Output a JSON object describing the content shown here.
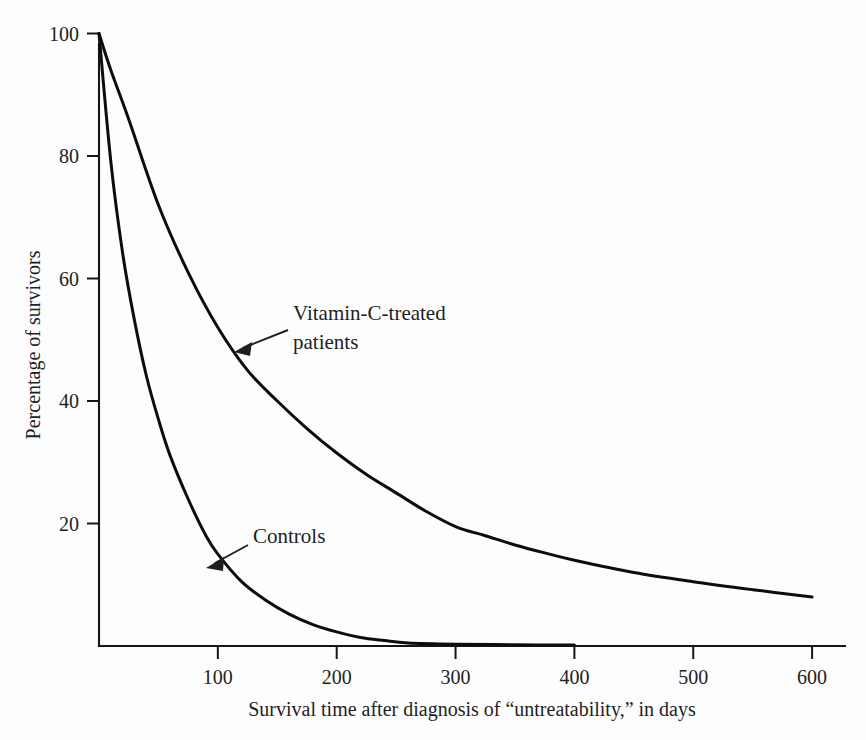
{
  "figure": {
    "background_color": "#fdfdfd",
    "ink_color": "#0d0d0d"
  },
  "chart_data": {
    "type": "line",
    "title": "",
    "xlabel": "Survival time after diagnosis of “untreatability,” in days",
    "ylabel": "Percentage of survivors",
    "xlim": [
      0,
      620
    ],
    "ylim": [
      0,
      104
    ],
    "grid": false,
    "legend": "none",
    "xticks": [
      100,
      200,
      300,
      400,
      500,
      600
    ],
    "xtick_labels": [
      "100",
      "200",
      "300",
      "400",
      "500",
      "600"
    ],
    "yticks": [
      20,
      40,
      60,
      80,
      100
    ],
    "ytick_labels": [
      "20",
      "40",
      "60",
      "80",
      "100"
    ],
    "series": [
      {
        "name": "Vitamin-C-treated patients",
        "x": [
          0,
          10,
          25,
          50,
          75,
          100,
          125,
          150,
          175,
          200,
          225,
          250,
          275,
          300,
          325,
          350,
          375,
          400,
          450,
          500,
          550,
          600
        ],
        "values": [
          100,
          94,
          86,
          72,
          61,
          52,
          45,
          40,
          35.5,
          31.5,
          28,
          25,
          22,
          19.5,
          18,
          16.5,
          15.2,
          14,
          12,
          10.5,
          9.2,
          8
        ]
      },
      {
        "name": "Controls",
        "x": [
          0,
          10,
          20,
          30,
          40,
          50,
          60,
          75,
          90,
          100,
          120,
          140,
          160,
          180,
          200,
          220,
          240,
          260,
          300,
          350,
          400
        ],
        "values": [
          100,
          79,
          64,
          53,
          44,
          37,
          31,
          24,
          18,
          15,
          10.5,
          7.5,
          5.2,
          3.5,
          2.3,
          1.4,
          0.9,
          0.5,
          0.3,
          0.2,
          0.15
        ]
      }
    ],
    "annotations": [
      {
        "label_line_1": "Vitamin-C-treated",
        "label_line_2": "patients",
        "points_to_series": "Vitamin-C-treated patients",
        "points_to_x": 115,
        "points_to_y": 48
      },
      {
        "label_line_1": "Controls",
        "label_line_2": "",
        "points_to_series": "Controls",
        "points_to_x": 95,
        "points_to_y": 15
      }
    ]
  }
}
